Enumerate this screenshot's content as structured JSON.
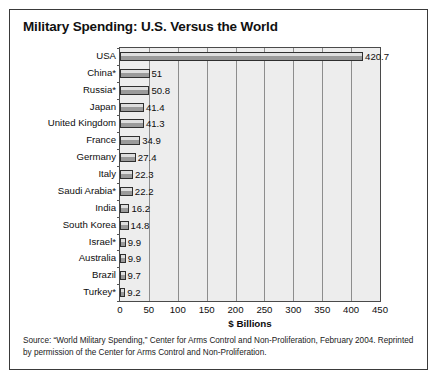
{
  "figure": {
    "title": "Military Spending: U.S. Versus the World",
    "source_note": "Source: “World Military Spending,” Center for Arms Control and Non-Proliferation, February 2004. Reprinted by permission of the Center for Arms Control and Non-Proliferation."
  },
  "chart_data": {
    "type": "bar",
    "orientation": "horizontal",
    "title": "Military Spending: U.S. Versus the World",
    "xlabel": "$ Billions",
    "ylabel": "",
    "xlim": [
      0,
      450
    ],
    "xticks": [
      0,
      50,
      100,
      150,
      200,
      250,
      300,
      350,
      400,
      450
    ],
    "xtick_labels": [
      "0",
      "50",
      "100",
      "150",
      "200",
      "250",
      "300",
      "350",
      "400",
      "450"
    ],
    "grid": true,
    "legend": "none",
    "categories": [
      "USA",
      "China*",
      "Russia*",
      "Japan",
      "United Kingdom",
      "France",
      "Germany",
      "Italy",
      "Saudi Arabia*",
      "India",
      "South Korea",
      "Israel*",
      "Australia",
      "Brazil",
      "Turkey*"
    ],
    "values": [
      420.7,
      51,
      50.8,
      41.4,
      41.3,
      34.9,
      27.4,
      22.3,
      22.2,
      16.2,
      14.8,
      9.9,
      9.9,
      9.7,
      9.2
    ],
    "value_labels": [
      "420.7",
      "51",
      "50.8",
      "41.4",
      "41.3",
      "34.9",
      "27.4",
      "22.3",
      "22.2",
      "16.2",
      "14.8",
      "9.9",
      "9.9",
      "9.7",
      "9.2"
    ],
    "colors": {
      "bar_fill": "#9a9a9a",
      "bar_highlight": "#dedede",
      "bar_outline": "#2f2f2f",
      "plot_background": "#ededed",
      "gridline": "#8d8d8d",
      "border": "#3a3a3a"
    }
  }
}
